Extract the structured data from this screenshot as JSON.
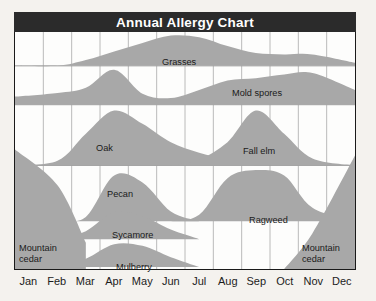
{
  "chart": {
    "title": "Annual Allergy Chart",
    "months": [
      "Jan",
      "Feb",
      "Mar",
      "Apr",
      "May",
      "Jun",
      "Jul",
      "Aug",
      "Sep",
      "Oct",
      "Nov",
      "Dec"
    ],
    "colors": {
      "title_bar": "#2b2b2b",
      "title_text": "#ffffff",
      "plot_background": "#fdfdfc",
      "page_background": "#f4f2ee",
      "area_fill": "#a8a8a8",
      "gridline": "#b9b9b9",
      "divider": "#9a9a9a",
      "border": "#1a1a1a",
      "label_text": "#1a1a1a"
    },
    "labels": {
      "grasses": "Grasses",
      "mold_spores": "Mold spores",
      "oak": "Oak",
      "fall_elm": "Fall elm",
      "pecan": "Pecan",
      "ragweed": "Ragweed",
      "sycamore": "Sycamore",
      "mulberry": "Mulberry",
      "mountain_cedar_left": "Mountain cedar",
      "mountain_cedar_right": "Mountain cedar"
    }
  },
  "chart_data": {
    "type": "area",
    "title": "Annual Allergy Chart",
    "xlabel": "",
    "ylabel": "",
    "grid": true,
    "legend": "none",
    "x": [
      "Jan",
      "Feb",
      "Mar",
      "Apr",
      "May",
      "Jun",
      "Jul",
      "Aug",
      "Sep",
      "Oct",
      "Nov",
      "Dec"
    ],
    "xlim": [
      "Jan",
      "Dec"
    ],
    "ylim": [
      0,
      1
    ],
    "note": "Each allergen occupies its own horizontal band; values are relative pollen/spore intensity 0-1 read off the silhouette height within its band.",
    "bands": [
      {
        "band": 1,
        "name": "Grasses",
        "series": [
          {
            "name": "Grasses",
            "values": [
              0.0,
              0.0,
              0.18,
              0.45,
              0.72,
              0.95,
              0.9,
              0.62,
              0.4,
              0.36,
              0.36,
              0.1
            ]
          }
        ]
      },
      {
        "band": 2,
        "name": "Mold spores",
        "series": [
          {
            "name": "Mold spores",
            "values": [
              0.22,
              0.32,
              0.46,
              0.95,
              0.3,
              0.18,
              0.4,
              0.66,
              0.72,
              0.82,
              0.86,
              0.4
            ]
          }
        ]
      },
      {
        "band": 3,
        "name": "Trees (spring / fall)",
        "series": [
          {
            "name": "Oak",
            "values": [
              0.0,
              0.08,
              0.55,
              0.95,
              0.72,
              0.4,
              0.22,
              0.1,
              0.0,
              0.0,
              0.0,
              0.0
            ]
          },
          {
            "name": "Fall elm",
            "values": [
              0.0,
              0.0,
              0.0,
              0.0,
              0.0,
              0.0,
              0.1,
              0.4,
              0.95,
              0.55,
              0.12,
              0.0
            ]
          }
        ]
      },
      {
        "band": 4,
        "name": "Pecan / Ragweed",
        "series": [
          {
            "name": "Pecan",
            "values": [
              0.0,
              0.0,
              0.08,
              0.85,
              0.72,
              0.18,
              0.0,
              0.0,
              0.0,
              0.0,
              0.0,
              0.0
            ]
          },
          {
            "name": "Ragweed",
            "values": [
              0.0,
              0.0,
              0.0,
              0.0,
              0.0,
              0.0,
              0.12,
              0.8,
              0.95,
              0.85,
              0.25,
              0.0
            ]
          }
        ]
      },
      {
        "band": 5,
        "name": "Sycamore",
        "series": [
          {
            "name": "Sycamore",
            "values": [
              0.0,
              0.0,
              0.25,
              0.85,
              0.72,
              0.3,
              0.0,
              0.0,
              0.0,
              0.0,
              0.0,
              0.0
            ]
          }
        ]
      },
      {
        "band": 6,
        "name": "Mulberry",
        "series": [
          {
            "name": "Mulberry",
            "values": [
              0.0,
              0.0,
              0.3,
              0.82,
              0.76,
              0.35,
              0.0,
              0.0,
              0.0,
              0.0,
              0.0,
              0.0
            ]
          }
        ]
      },
      {
        "band": 7,
        "name": "Mountain cedar",
        "series": [
          {
            "name": "Mountain cedar (winter)",
            "values": [
              1.0,
              0.7,
              0.22,
              0.0,
              0.0,
              0.0,
              0.0,
              0.0,
              0.0,
              0.0,
              0.3,
              0.95
            ]
          }
        ]
      }
    ]
  }
}
